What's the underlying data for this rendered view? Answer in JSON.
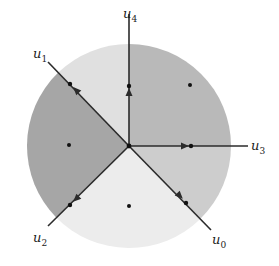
{
  "diagram": {
    "type": "fan / polyhedral cone partition of a disk",
    "center": [
      129,
      146
    ],
    "radius": 102,
    "rays": [
      {
        "id": "u0",
        "label": "u",
        "sub": "0",
        "end": [
          211,
          230
        ],
        "label_pos": [
          212,
          244
        ],
        "dot": [
          186,
          203
        ],
        "arrow": [
          180,
          196
        ]
      },
      {
        "id": "u1",
        "label": "u",
        "sub": "1",
        "end": [
          48,
          62
        ],
        "label_pos": [
          33,
          58
        ],
        "dot": [
          70,
          84
        ],
        "arrow": [
          76,
          90
        ]
      },
      {
        "id": "u2",
        "label": "u",
        "sub": "2",
        "end": [
          48,
          226
        ],
        "label_pos": [
          33,
          242
        ],
        "dot": [
          70,
          205
        ],
        "arrow": [
          76,
          199
        ]
      },
      {
        "id": "u3",
        "label": "u",
        "sub": "3",
        "end": [
          248,
          146
        ],
        "label_pos": [
          251,
          150
        ],
        "dot": [
          191,
          146
        ],
        "arrow": [
          185,
          146
        ]
      },
      {
        "id": "u4",
        "label": "u",
        "sub": "4",
        "end": [
          129,
          14
        ],
        "label_pos": [
          123,
          18
        ],
        "dot": [
          129,
          86
        ],
        "arrow": [
          129,
          92
        ]
      }
    ],
    "regions": [
      {
        "id": "cone-u4-u3",
        "color": "#b9b9b9",
        "point": [
          190,
          85
        ]
      },
      {
        "id": "cone-u3-u0",
        "color": "#cdcdcd",
        "point": null
      },
      {
        "id": "cone-u0-u2",
        "color": "#ececec",
        "point": [
          129,
          206
        ]
      },
      {
        "id": "cone-u2-u1",
        "color": "#a6a6a6",
        "point": [
          69,
          145
        ]
      },
      {
        "id": "cone-u1-u4",
        "color": "#e0e0e0",
        "point": null
      }
    ],
    "line_color": "#2b2b2b"
  }
}
